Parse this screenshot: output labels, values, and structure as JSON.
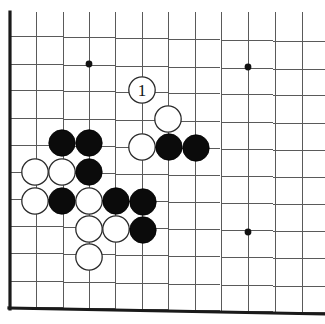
{
  "figure": {
    "type": "go-board-diagram",
    "board_region": "lower-left corner",
    "background_color": "#ffffff",
    "line_color": "#5a5a5a",
    "edge_color": "#1a1a1a",
    "black_stone_color": "#0b0b0b",
    "white_stone_color": "#ffffff"
  },
  "grid": {
    "columns": 12,
    "rows": 11,
    "column_x": [
      10,
      36,
      63,
      89,
      115,
      142,
      168,
      195,
      221,
      248,
      275,
      302
    ],
    "row_y": [
      36,
      64,
      90,
      118,
      145,
      172,
      199,
      226,
      253,
      281,
      307
    ],
    "left_edge_is_board_border": true,
    "bottom_edge_is_board_border": true,
    "top_edge_cropped": true,
    "right_edge_cropped": true
  },
  "star_points": [
    {
      "name": "star-point-left",
      "x": 89,
      "y": 64
    },
    {
      "name": "star-point-right",
      "x": 248,
      "y": 67
    },
    {
      "name": "star-point-lower-right",
      "x": 248,
      "y": 232
    }
  ],
  "stones": [
    {
      "id": "w-1",
      "color": "white",
      "x": 142,
      "y": 90,
      "label": "1"
    },
    {
      "id": "w-2",
      "color": "white",
      "x": 168,
      "y": 119,
      "label": ""
    },
    {
      "id": "b-1",
      "color": "black",
      "x": 62,
      "y": 143,
      "label": ""
    },
    {
      "id": "b-2",
      "color": "black",
      "x": 89,
      "y": 143,
      "label": ""
    },
    {
      "id": "w-3",
      "color": "white",
      "x": 142,
      "y": 147,
      "label": ""
    },
    {
      "id": "b-3",
      "color": "black",
      "x": 169,
      "y": 147,
      "label": ""
    },
    {
      "id": "b-4",
      "color": "black",
      "x": 196,
      "y": 148,
      "label": ""
    },
    {
      "id": "w-4",
      "color": "white",
      "x": 35,
      "y": 172,
      "label": ""
    },
    {
      "id": "w-5",
      "color": "white",
      "x": 62,
      "y": 172,
      "label": ""
    },
    {
      "id": "b-5",
      "color": "black",
      "x": 89,
      "y": 172,
      "label": ""
    },
    {
      "id": "w-6",
      "color": "white",
      "x": 35,
      "y": 201,
      "label": ""
    },
    {
      "id": "b-6",
      "color": "black",
      "x": 62,
      "y": 201,
      "label": ""
    },
    {
      "id": "w-7",
      "color": "white",
      "x": 89,
      "y": 201,
      "label": ""
    },
    {
      "id": "b-7",
      "color": "black",
      "x": 116,
      "y": 201,
      "label": ""
    },
    {
      "id": "b-8",
      "color": "black",
      "x": 143,
      "y": 202,
      "label": ""
    },
    {
      "id": "w-8",
      "color": "white",
      "x": 89,
      "y": 229,
      "label": ""
    },
    {
      "id": "w-9",
      "color": "white",
      "x": 116,
      "y": 229,
      "label": ""
    },
    {
      "id": "b-9",
      "color": "black",
      "x": 143,
      "y": 230,
      "label": ""
    },
    {
      "id": "w-10",
      "color": "white",
      "x": 89,
      "y": 257,
      "label": ""
    }
  ],
  "stone_radius": 13.2,
  "marked_move": {
    "label": "1",
    "color": "white",
    "description": "White move number 1"
  }
}
